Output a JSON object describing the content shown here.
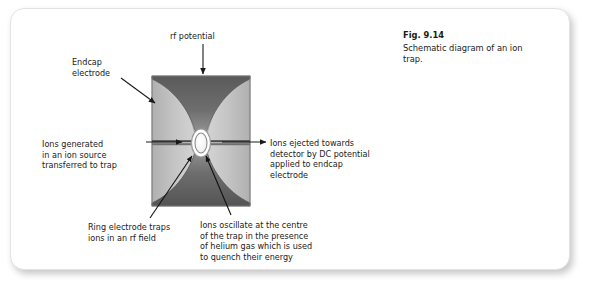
{
  "figure": {
    "caption_number": "Fig. 9.14",
    "caption_text": "Schematic diagram of an ion trap."
  },
  "annotations": {
    "rf_potential": "rf potential",
    "endcap_electrode": "Endcap\nelectrode",
    "ions_generated": "Ions generated\nin an ion source\ntransferred to trap",
    "ions_ejected": "Ions ejected towards\ndetector by DC potential\napplied to endcap\nelectrode",
    "ring_electrode": "Ring electrode traps\nions in an rf field",
    "ions_oscillate": "Ions oscillate at the centre\nof the trap in the presence\nof helium gas which is used\nto quench their energy"
  },
  "colors": {
    "card_background": "#ffffff",
    "card_border": "#e3e3e3",
    "text": "#1a1a1a",
    "electrode_dark": "#4d4d4d",
    "electrode_mid": "#7a7a7a",
    "electrode_light": "#b8b8b8",
    "panel_light_gray": "#c9c9c9",
    "panel_outline": "#8a8a8a",
    "arrow": "#1a1a1a",
    "center_oval_fill": "#fdfdfd",
    "center_oval_stroke": "#9a9a9a"
  },
  "diagram": {
    "box": {
      "x": 152,
      "y": 76,
      "width": 98,
      "height": 130
    },
    "center_oval": {
      "cx": 201,
      "cy": 143,
      "rx": 8.5,
      "ry": 13
    },
    "elements": [
      "top-endcap-electrode",
      "bottom-endcap-electrode",
      "left-ring-electrode",
      "right-ring-electrode",
      "center-ion-cloud"
    ]
  }
}
